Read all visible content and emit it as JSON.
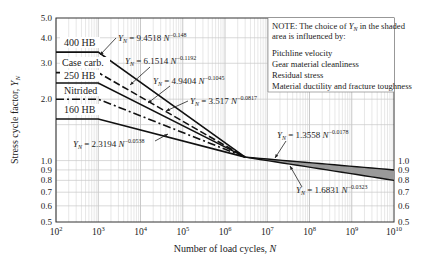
{
  "chart_data": {
    "type": "line",
    "title": "",
    "xlabel": "Number of load cycles, N",
    "ylabel": "Stress cycle factor, Y_N",
    "xscale": "log",
    "yscale": "log",
    "xlim": [
      100,
      10000000000
    ],
    "ylim": [
      0.5,
      5.0
    ],
    "grid": true,
    "x_ticks": [
      "10^2",
      "10^3",
      "10^4",
      "10^5",
      "10^6",
      "10^7",
      "10^8",
      "10^9",
      "10^10"
    ],
    "y_ticks_left": [
      "0.5",
      "0.6",
      "0.7",
      "0.8",
      "0.9",
      "1.0",
      "2.0",
      "3.0",
      "4.0",
      "5.0"
    ],
    "y_ticks_right": [
      "0.5",
      "0.6",
      "0.7",
      "0.8",
      "0.9",
      "1.0"
    ],
    "knee_N": 1000,
    "converge_N": 3000000,
    "series": [
      {
        "name": "400 HB",
        "style": "solid",
        "flat_value": 3.4,
        "equation": {
          "coef": "9.4518",
          "exp": "−0.148"
        }
      },
      {
        "name": "Case carb.",
        "style": "dashed",
        "flat_value": 2.7,
        "equation": {
          "coef": "6.1514",
          "exp": "−0.1192"
        }
      },
      {
        "name": "250 HB",
        "style": "solid",
        "flat_value": 2.4,
        "equation": {
          "coef": "4.9404",
          "exp": "−0.1045"
        }
      },
      {
        "name": "Nitrided",
        "style": "dashdot",
        "flat_value": 2.0,
        "equation": {
          "coef": "3.517",
          "exp": "−0.0817"
        }
      },
      {
        "name": "160 HB",
        "style": "solid",
        "flat_value": 1.6,
        "equation": {
          "coef": "2.3194",
          "exp": "−0.0538"
        }
      }
    ],
    "shaded_band": {
      "upper": {
        "equation": {
          "coef": "1.3558",
          "exp": "−0.0178"
        },
        "value_at_1e10": 0.9
      },
      "lower": {
        "equation": {
          "coef": "1.6831",
          "exp": "−0.0323"
        },
        "value_at_1e10": 0.8
      }
    },
    "note": {
      "lines": [
        "NOTE:  The choice of Y_N in the shaded",
        "area is influenced by:",
        "",
        "Pitchline velocity",
        "Gear material cleanliness",
        "Residual stress",
        "Material ductility and fracture toughness"
      ]
    }
  },
  "labels": {
    "yn_symbol": "Y",
    "yn_sub": "N",
    "eq_mid": " = ",
    "eq_N": " N",
    "note_title": "NOTE:  The choice of ",
    "note_title_end": " in the shaded",
    "note_line2": "area is influenced by:",
    "note_item1": "Pitchline velocity",
    "note_item2": "Gear material cleanliness",
    "note_item3": "Residual stress",
    "note_item4": "Material ductility and fracture toughness",
    "xlabel": "Number of load cycles, ",
    "xlabel_var": "N",
    "ylabel": "Stress cycle factor, ",
    "ylabel_var": "Y",
    "ylabel_sub": "N"
  }
}
